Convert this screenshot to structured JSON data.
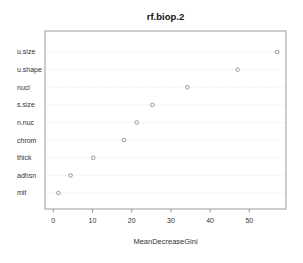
{
  "figure": {
    "background": "#ffffff"
  },
  "chart_data": {
    "type": "scatter",
    "subtype": "dotchart-variable-importance",
    "title": "rf.biop.2",
    "xlabel": "MeanDecreaseGini",
    "ylabel": "",
    "categories": [
      "u.size",
      "u.shape",
      "nucl",
      "s.size",
      "n.nuc",
      "chrom",
      "thick",
      "adhsn",
      "mit"
    ],
    "values": [
      57.1,
      47.0,
      34.2,
      25.3,
      21.3,
      18.0,
      10.2,
      4.4,
      1.3
    ],
    "x_ticks": [
      0,
      10,
      20,
      30,
      40,
      50
    ],
    "xlim": [
      -2.1,
      59.4
    ],
    "grid": "horizontal-dotted",
    "legend": "none",
    "point_style": "open-circle",
    "colors": {
      "point_stroke": "#8c8c8c",
      "point_fill": "#ffffff",
      "grid_line": "#d9d9d9",
      "box_border": "#999999",
      "tick": "#999999",
      "text": "#333333",
      "title_text": "#111111"
    }
  }
}
